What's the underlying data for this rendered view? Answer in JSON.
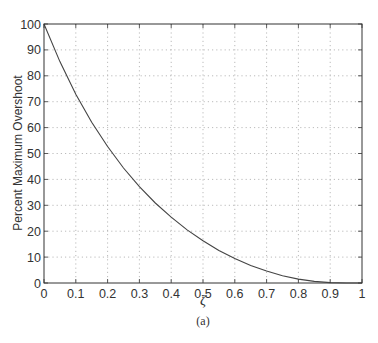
{
  "chart_data": {
    "type": "line",
    "title": "",
    "xlabel": "ζ",
    "ylabel": "Percent Maximum Overshoot",
    "caption": "(a)",
    "xlim": [
      0,
      1
    ],
    "ylim": [
      0,
      100
    ],
    "grid": true,
    "x_ticks": [
      "0",
      "0.1",
      "0.2",
      "0.3",
      "0.4",
      "0.5",
      "0.6",
      "0.7",
      "0.8",
      "0.9",
      "1"
    ],
    "y_ticks": [
      "0",
      "10",
      "20",
      "30",
      "40",
      "50",
      "60",
      "70",
      "80",
      "90",
      "100"
    ],
    "series": [
      {
        "name": "%OS",
        "color": "#444444",
        "x": [
          0,
          0.05,
          0.1,
          0.15,
          0.2,
          0.25,
          0.3,
          0.35,
          0.4,
          0.45,
          0.5,
          0.55,
          0.6,
          0.65,
          0.7,
          0.75,
          0.8,
          0.85,
          0.9,
          0.95,
          1.0
        ],
        "values": [
          100,
          85.5,
          72.9,
          62.1,
          52.7,
          44.4,
          37.2,
          30.9,
          25.4,
          20.5,
          16.3,
          12.6,
          9.5,
          6.8,
          4.6,
          2.8,
          1.5,
          0.63,
          0.15,
          0.01,
          0
        ]
      }
    ]
  }
}
